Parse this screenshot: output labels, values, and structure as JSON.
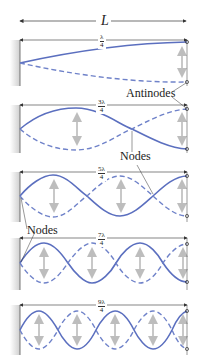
{
  "title_label": "L",
  "colors": {
    "solid_wave": "#5b6fbf",
    "dashed_wave": "#6f82c9",
    "arrow": "#c8c8c8",
    "dimension": "#333333",
    "wall": "#d9d9d9"
  },
  "panels": [
    {
      "length_num": "λ",
      "length_den": "4",
      "mode": "1/4 wavelength",
      "half_loops": 1
    },
    {
      "length_num": "3λ",
      "length_den": "4",
      "mode": "3/4 wavelength",
      "half_loops": 3
    },
    {
      "length_num": "5λ",
      "length_den": "4",
      "mode": "5/4 wavelength",
      "half_loops": 5
    },
    {
      "length_num": "7λ",
      "length_den": "4",
      "mode": "7/4 wavelength",
      "half_loops": 7
    },
    {
      "length_num": "9λ",
      "length_den": "4",
      "mode": "9/4 wavelength",
      "half_loops": 9
    }
  ],
  "annotations": {
    "antinodes": "Antinodes",
    "nodes_upper": "Nodes",
    "nodes_lower": "Nodes"
  }
}
